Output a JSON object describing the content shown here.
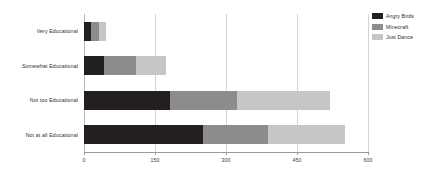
{
  "chart_data": {
    "type": "bar",
    "orientation": "horizontal",
    "stacked": true,
    "title": "",
    "xlabel": "",
    "ylabel": "",
    "categories": [
      "Very Educational",
      "Somewhat Educational",
      "Not too Educational",
      "Not at all Educational"
    ],
    "series": [
      {
        "name": "Angry Birds",
        "color": "#231f20",
        "values": [
          15,
          42,
          182,
          252
        ]
      },
      {
        "name": "Minecraft",
        "color": "#8c8c8c",
        "values": [
          17,
          68,
          141,
          137
        ]
      },
      {
        "name": "Just Dance",
        "color": "#c6c6c6",
        "values": [
          15,
          63,
          197,
          163
        ]
      }
    ],
    "totals": [
      47,
      173,
      520,
      552
    ],
    "xlim": [
      0,
      600
    ],
    "xticks": [
      0,
      150,
      300,
      450,
      600
    ],
    "xtick_labels": [
      "0",
      "150",
      "300",
      "450",
      "600"
    ],
    "grid": true,
    "grid_axis": "x",
    "legend_position": "top-right"
  },
  "legend": {
    "items": [
      {
        "label": "Angry Birds",
        "color": "#231f20"
      },
      {
        "label": "Minecraft",
        "color": "#8c8c8c"
      },
      {
        "label": "Just Dance",
        "color": "#c6c6c6"
      }
    ]
  },
  "axis": {
    "x_tick_labels": [
      "0",
      "150",
      "300",
      "450",
      "600"
    ]
  }
}
